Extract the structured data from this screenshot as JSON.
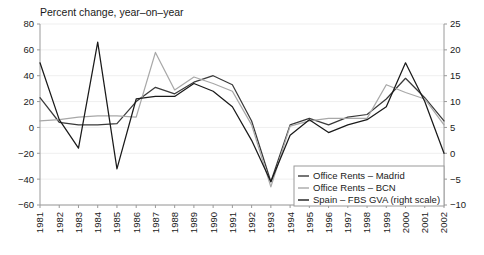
{
  "chart_data": {
    "type": "line",
    "title": "Percent change, year–on–year",
    "xlabel": "",
    "ylabel": "",
    "y2label": "",
    "grid": true,
    "legend_position": "bottom-right",
    "x": [
      1981,
      1982,
      1983,
      1984,
      1985,
      1986,
      1987,
      1988,
      1989,
      1990,
      1991,
      1992,
      1993,
      1994,
      1995,
      1996,
      1997,
      1998,
      1999,
      2000,
      2001,
      2002
    ],
    "xtick_labels": [
      "1981",
      "1982",
      "1983",
      "1984",
      "1985",
      "1986",
      "1987",
      "1988",
      "1989",
      "1990",
      "1991",
      "1992",
      "1993",
      "1994",
      "1995",
      "1996",
      "1997",
      "1998",
      "1999",
      "2000",
      "2001",
      "2002"
    ],
    "ylim": [
      -60,
      80
    ],
    "ytick_labels": [
      "80",
      "60",
      "40",
      "20",
      "0",
      "−20",
      "−40",
      "−60"
    ],
    "yticks": [
      80,
      60,
      40,
      20,
      0,
      -20,
      -40,
      -60
    ],
    "y2lim": [
      -10,
      25
    ],
    "y2tick_labels": [
      "25",
      "20",
      "15",
      "10",
      "5",
      "0",
      "−5",
      "−10"
    ],
    "y2ticks": [
      25,
      20,
      15,
      10,
      5,
      0,
      -5,
      -10
    ],
    "series": [
      {
        "name": "Office Rents – Madrid",
        "axis": "left",
        "color": "#3a3a3a",
        "values": [
          23,
          4,
          2,
          2,
          3,
          20,
          31,
          26,
          35,
          40,
          33,
          5,
          -42,
          2,
          7,
          2,
          8,
          10,
          22,
          38,
          23,
          5
        ]
      },
      {
        "name": "Office Rents – BCN",
        "axis": "left",
        "color": "#a8a8a8",
        "values": [
          5,
          6,
          8,
          9,
          9,
          8,
          58,
          29,
          39,
          34,
          28,
          2,
          -46,
          1,
          5,
          7,
          7,
          7,
          33,
          27,
          22,
          2
        ]
      },
      {
        "name": "Spain – FBS GVA (right scale)",
        "axis": "right",
        "color": "#1a1a1a",
        "values": [
          17.5,
          6.5,
          1.0,
          21.5,
          -3.0,
          10.5,
          11.0,
          11.0,
          13.5,
          12.0,
          9.0,
          2.5,
          -5.5,
          3.5,
          6.5,
          4.0,
          5.5,
          6.5,
          9.0,
          17.5,
          10.0,
          0.0
        ]
      }
    ],
    "legend": [
      {
        "label": "Office Rents – Madrid",
        "color": "#3a3a3a"
      },
      {
        "label": "Office Rents – BCN",
        "color": "#a8a8a8"
      },
      {
        "label": "Spain – FBS GVA (right scale)",
        "color": "#1a1a1a"
      }
    ]
  }
}
